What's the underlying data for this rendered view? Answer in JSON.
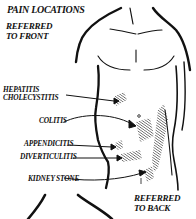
{
  "figure": {
    "title": "PAIN LOCATIONS",
    "front_caption_line1": "REFERRED",
    "front_caption_line2": "TO FRONT",
    "back_caption_line1": "REFERRED",
    "back_caption_line2": "TO BACK",
    "labels": [
      {
        "line1": "HEPATITIS",
        "line2": "CHOLECYSTITIS"
      },
      {
        "line1": "COLITIS"
      },
      {
        "line1": "APPENDICITIS"
      },
      {
        "line1": "DIVERTICULITIS"
      },
      {
        "line1": "KIDNEY STONE"
      }
    ]
  }
}
